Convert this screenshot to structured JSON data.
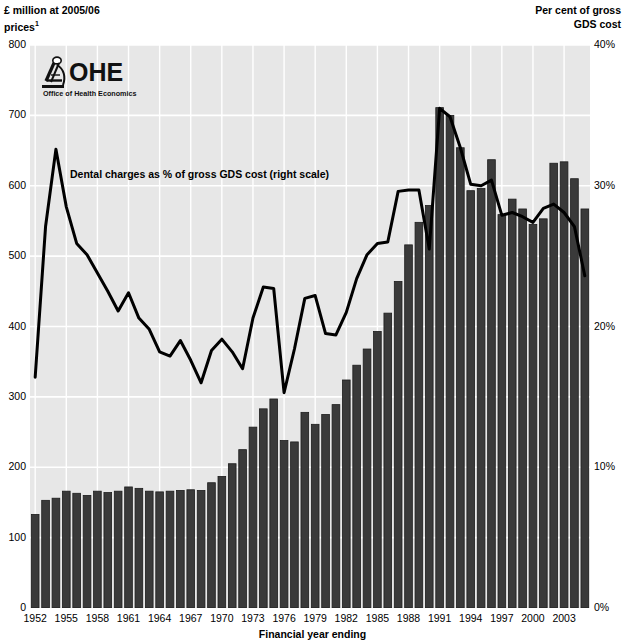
{
  "axes": {
    "left_title": "£ million at 2005/06\nprices",
    "left_title_superscript": "1",
    "right_title": "Per cent of gross\nGDS cost",
    "x_caption": "Financial year ending",
    "left_ticks": [
      "800",
      "700",
      "600",
      "500",
      "400",
      "300",
      "200",
      "100",
      "0"
    ],
    "right_ticks": [
      "40%",
      "30%",
      "20%",
      "10%",
      "0%"
    ]
  },
  "annotation": {
    "line_label": "Dental charges as % of gross GDS cost (right scale)"
  },
  "logo": {
    "name": "OHE",
    "subtitle": "Office of Health Economics",
    "icon": "ohe-microscope-icon"
  },
  "chart_data": {
    "type": "bar",
    "title": "",
    "subtitle": "",
    "xlabel": "Financial year ending",
    "ylabel": "£ million at 2005/06 prices",
    "y2label": "Per cent of gross GDS cost",
    "ylim": [
      0,
      800
    ],
    "y2lim": [
      0,
      40
    ],
    "grid": true,
    "legend_position": "inline-annotation",
    "xtick_step": 3,
    "xtick_labels": [
      "1952",
      "1955",
      "1958",
      "1961",
      "1964",
      "1967",
      "1970",
      "1973",
      "1976",
      "1979",
      "1982",
      "1985",
      "1988",
      "1991",
      "1994",
      "1997",
      "2000",
      "2003"
    ],
    "categories": [
      1952,
      1953,
      1954,
      1955,
      1956,
      1957,
      1958,
      1959,
      1960,
      1961,
      1962,
      1963,
      1964,
      1965,
      1966,
      1967,
      1968,
      1969,
      1970,
      1971,
      1972,
      1973,
      1974,
      1975,
      1976,
      1977,
      1978,
      1979,
      1980,
      1981,
      1982,
      1983,
      1984,
      1985,
      1986,
      1987,
      1988,
      1989,
      1990,
      1991,
      1992,
      1993,
      1994,
      1995,
      1996,
      1997,
      1998,
      1999,
      2000,
      2001,
      2002,
      2003,
      2004,
      2005
    ],
    "series": [
      {
        "name": "Gross GDS cost",
        "type": "bar",
        "axis": "left",
        "unit": "£ million at 2005/06 prices",
        "color": "#3a3a3a",
        "values": [
          133,
          153,
          156,
          166,
          163,
          160,
          166,
          164,
          166,
          172,
          170,
          166,
          165,
          166,
          167,
          168,
          167,
          178,
          187,
          205,
          225,
          257,
          283,
          297,
          238,
          236,
          278,
          261,
          275,
          289,
          324,
          345,
          368,
          393,
          419,
          464,
          516,
          548,
          572,
          711,
          700,
          654,
          593,
          596,
          637,
          559,
          581,
          567,
          545,
          553,
          632,
          634,
          610,
          567
        ]
      },
      {
        "name": "Dental charges as % of gross GDS cost",
        "type": "line",
        "axis": "right",
        "unit": "per cent",
        "color": "#000000",
        "values": [
          16.4,
          27.1,
          32.6,
          28.5,
          25.9,
          25.1,
          23.8,
          22.5,
          21.1,
          22.4,
          20.6,
          19.8,
          18.2,
          17.9,
          19.0,
          17.6,
          16.0,
          18.3,
          19.1,
          18.2,
          17.0,
          20.6,
          22.8,
          22.7,
          15.3,
          18.4,
          22.0,
          22.2,
          19.5,
          19.4,
          21.0,
          23.4,
          25.1,
          25.9,
          26.0,
          29.6,
          29.7,
          29.7,
          25.5,
          35.5,
          34.9,
          32.7,
          30.1,
          30.0,
          30.4,
          27.9,
          28.1,
          27.8,
          27.4,
          28.4,
          28.7,
          28.1,
          27.1,
          23.6
        ]
      }
    ]
  }
}
